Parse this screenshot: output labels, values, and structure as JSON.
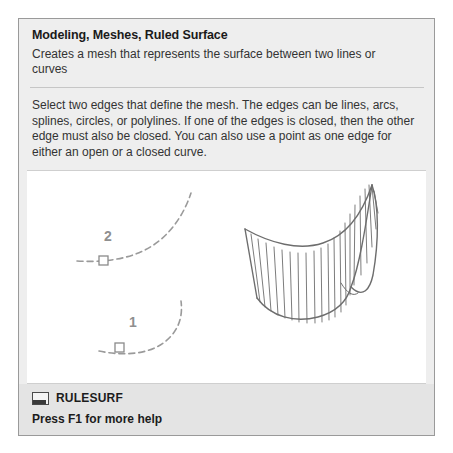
{
  "tooltip": {
    "title": "Modeling, Meshes, Ruled Surface",
    "summary": "Creates a mesh that represents the surface between two lines or curves",
    "description": "Select two edges that define the mesh. The edges can be lines, arcs, splines, circles, or polylines. If one of the edges is closed, then the other edge must also be closed. You can also use a point as one edge for either an open or a closed curve.",
    "footer": {
      "command_icon": "command-monitor-icon",
      "command_name": "RULESURF",
      "help_text": "Press F1 for more help"
    },
    "illustration": {
      "alt": "ruled-surface-diagram",
      "labels": [
        {
          "text": "2",
          "x": 99,
          "y": 248
        },
        {
          "text": "1",
          "x": 124,
          "y": 334
        }
      ],
      "markers": [
        {
          "name": "edge-marker-2",
          "x": 94,
          "y": 268
        },
        {
          "name": "edge-marker-1",
          "x": 110,
          "y": 355
        }
      ],
      "colors": {
        "curve": "#9a9a9a",
        "mesh": "#6d6d6d",
        "label": "#8a8a8a",
        "panel_bg": "#eeeeee",
        "canvas_bg": "#ffffff",
        "footer_bg": "#e4e4e4",
        "border": "#9a9a9a"
      }
    }
  }
}
